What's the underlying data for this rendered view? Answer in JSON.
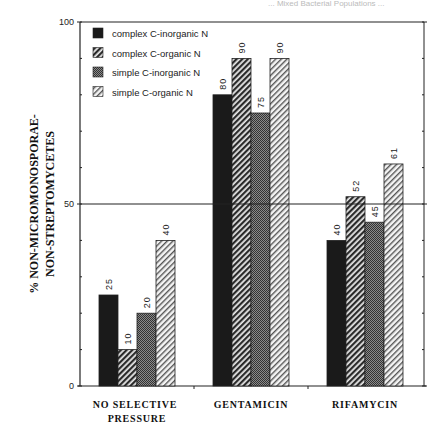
{
  "page_header": "... Mixed Bacterial Populations ...",
  "chart_data": {
    "type": "bar",
    "title": "",
    "xlabel": "",
    "ylabel_lines": [
      "% NON-MICROMONOSPORAE-",
      "NON-STREPTOMYCETES"
    ],
    "ylim": [
      0,
      100
    ],
    "yticks": [
      0,
      50,
      100
    ],
    "minor_ytick_step": 10,
    "reference_line": 50,
    "grid": false,
    "legend_position": "upper-left-inside",
    "categories": [
      [
        "NO  SELECTIVE",
        "PRESSURE"
      ],
      [
        "GENTAMICIN"
      ],
      [
        "RIFAMYCIN"
      ]
    ],
    "series": [
      {
        "name": "complex C-inorganic N",
        "pattern": "solid-black",
        "values": [
          25,
          80,
          40
        ]
      },
      {
        "name": "complex C-organic N",
        "pattern": "dense-diagonal-hatch",
        "values": [
          10,
          90,
          52
        ]
      },
      {
        "name": "simple C-inorganic N",
        "pattern": "dark-gray-stipple",
        "values": [
          20,
          75,
          45
        ]
      },
      {
        "name": "simple C-organic N",
        "pattern": "light-diagonal-hatch",
        "values": [
          40,
          90,
          61
        ]
      }
    ]
  },
  "colors": {
    "axis": "#222222",
    "solid": "#1a1a1a",
    "hatch_dense": "#333333",
    "stipple": "#555555",
    "hatch_light": "#777777"
  }
}
